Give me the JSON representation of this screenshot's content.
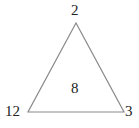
{
  "diagram": {
    "type": "triangle-number-puzzle",
    "vertices": {
      "top": "2",
      "bottom_left": "12",
      "bottom_right": "3"
    },
    "center": "8",
    "colors": {
      "stroke": "#8a8a8a",
      "text": "#222222",
      "background": "#ffffff"
    }
  }
}
